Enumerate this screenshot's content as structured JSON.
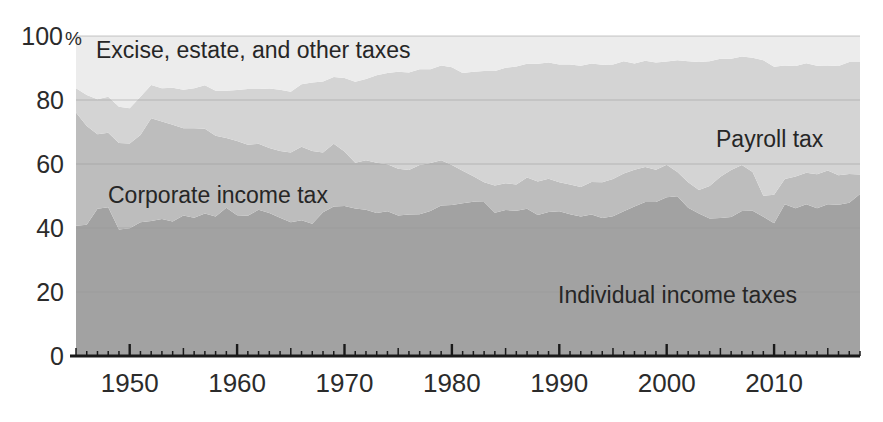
{
  "chart_data": {
    "type": "area",
    "stacked": true,
    "normalized_percent": true,
    "title": "",
    "subtitle": "",
    "xlabel": "",
    "ylabel": "",
    "ylim": [
      0,
      100
    ],
    "xlim": [
      1945,
      2018
    ],
    "grid": true,
    "legend_position": "inline-annotations",
    "y_ticks": [
      0,
      20,
      40,
      60,
      80,
      100
    ],
    "y_tick_labels": [
      "0",
      "20",
      "40",
      "60",
      "80",
      "100"
    ],
    "y_axis_unit_suffix": "%",
    "x_ticks_major": [
      1950,
      1960,
      1970,
      1980,
      1990,
      2000,
      2010
    ],
    "x_tick_labels": [
      "1950",
      "1960",
      "1970",
      "1980",
      "1990",
      "2000",
      "2010"
    ],
    "x_minor_tick_interval": 1,
    "x_major_tick_interval": 10,
    "colors": {
      "individual_income_taxes": "#a2a2a2",
      "corporate_income_tax": "#bdbdbd",
      "payroll_tax": "#d4d4d4",
      "excise_estate_other": "#ececec",
      "axis": "#1a1a1a",
      "gridline": "#9a9a9a",
      "text": "#262626",
      "background": "#ffffff"
    },
    "annotations": [
      {
        "name": "excise-estate-other-label",
        "text": "Excise, estate, and other taxes",
        "x_px": 96,
        "y_px": 58
      },
      {
        "name": "payroll-tax-label",
        "text": "Payroll tax",
        "x_px": 716,
        "y_px": 147
      },
      {
        "name": "corporate-income-tax-label",
        "text": "Corporate income tax",
        "x_px": 108,
        "y_px": 203
      },
      {
        "name": "individual-income-taxes-label",
        "text": "Individual income taxes",
        "x_px": 558,
        "y_px": 303
      }
    ],
    "x": [
      1945,
      1946,
      1947,
      1948,
      1949,
      1950,
      1951,
      1952,
      1953,
      1954,
      1955,
      1956,
      1957,
      1958,
      1959,
      1960,
      1961,
      1962,
      1963,
      1964,
      1965,
      1966,
      1967,
      1968,
      1969,
      1970,
      1971,
      1972,
      1973,
      1974,
      1975,
      1976,
      1977,
      1978,
      1979,
      1980,
      1981,
      1982,
      1983,
      1984,
      1985,
      1986,
      1987,
      1988,
      1989,
      1990,
      1991,
      1992,
      1993,
      1994,
      1995,
      1996,
      1997,
      1998,
      1999,
      2000,
      2001,
      2002,
      2003,
      2004,
      2005,
      2006,
      2007,
      2008,
      2009,
      2010,
      2011,
      2012,
      2013,
      2014,
      2015,
      2016,
      2017,
      2018
    ],
    "series": [
      {
        "name": "Individual income taxes",
        "key": "individual_income_taxes",
        "color": "#a2a2a2",
        "values": [
          40.7,
          41.0,
          46.0,
          46.5,
          39.5,
          39.9,
          41.8,
          42.2,
          42.8,
          42.0,
          43.9,
          43.2,
          44.5,
          43.6,
          46.3,
          44.0,
          43.8,
          45.7,
          44.7,
          43.2,
          41.8,
          42.4,
          41.3,
          44.9,
          46.7,
          46.9,
          46.1,
          45.7,
          44.7,
          45.2,
          43.9,
          44.2,
          44.3,
          45.3,
          47.0,
          47.2,
          47.7,
          48.2,
          48.1,
          44.8,
          45.6,
          45.4,
          46.0,
          44.1,
          45.0,
          45.2,
          44.3,
          43.6,
          44.2,
          43.1,
          43.7,
          45.2,
          46.7,
          48.1,
          48.1,
          49.6,
          49.9,
          46.3,
          44.5,
          43.0,
          43.1,
          43.4,
          45.3,
          45.4,
          43.5,
          41.5,
          47.4,
          46.2,
          47.4,
          46.2,
          47.4,
          47.3,
          47.9,
          50.6
        ]
      },
      {
        "name": "Corporate income tax",
        "key": "corporate_income_tax",
        "color": "#bdbdbd",
        "values": [
          35.4,
          30.9,
          23.3,
          23.3,
          27.1,
          26.5,
          27.3,
          32.1,
          30.5,
          30.3,
          27.3,
          28.0,
          26.5,
          25.2,
          21.8,
          23.2,
          22.2,
          20.6,
          20.3,
          20.9,
          21.8,
          23.0,
          22.8,
          18.7,
          19.6,
          17.0,
          14.3,
          15.5,
          15.7,
          14.7,
          14.6,
          13.9,
          15.4,
          15.0,
          14.2,
          12.5,
          10.2,
          8.0,
          6.2,
          8.5,
          8.4,
          8.2,
          9.8,
          10.4,
          10.4,
          9.1,
          9.3,
          9.2,
          10.2,
          11.2,
          11.6,
          11.8,
          11.5,
          11.0,
          10.1,
          10.2,
          7.6,
          8.0,
          7.4,
          10.1,
          12.9,
          14.7,
          14.4,
          12.1,
          6.6,
          8.9,
          7.9,
          9.9,
          9.9,
          10.6,
          10.6,
          9.2,
          9.0,
          6.1
        ]
      },
      {
        "name": "Payroll tax",
        "key": "payroll_tax",
        "color": "#d4d4d4",
        "values": [
          7.6,
          9.7,
          10.9,
          11.2,
          11.3,
          11.0,
          11.9,
          10.4,
          10.4,
          11.5,
          12.0,
          12.5,
          13.6,
          14.1,
          14.8,
          15.9,
          17.4,
          17.1,
          18.6,
          19.1,
          19.0,
          19.5,
          21.4,
          22.2,
          20.9,
          23.0,
          25.3,
          25.4,
          27.3,
          28.5,
          30.3,
          30.5,
          29.9,
          29.3,
          29.6,
          30.5,
          30.5,
          32.6,
          34.8,
          35.8,
          36.1,
          36.9,
          35.5,
          36.8,
          36.3,
          36.8,
          37.5,
          37.9,
          37.0,
          36.7,
          35.8,
          35.1,
          33.2,
          33.2,
          33.5,
          32.2,
          34.9,
          37.8,
          40.0,
          39.0,
          36.9,
          34.8,
          33.9,
          35.7,
          42.3,
          40.0,
          35.5,
          34.5,
          34.2,
          33.9,
          32.8,
          34.1,
          35.0,
          35.2
        ]
      },
      {
        "name": "Excise, estate, and other taxes",
        "key": "excise_estate_other",
        "color": "#ececec",
        "values": [
          16.3,
          18.4,
          19.8,
          19.0,
          22.1,
          22.6,
          19.0,
          15.3,
          16.3,
          16.2,
          16.8,
          16.3,
          15.4,
          17.1,
          17.1,
          16.9,
          16.6,
          16.6,
          16.4,
          16.8,
          17.4,
          15.1,
          14.5,
          14.2,
          12.8,
          13.1,
          14.3,
          13.4,
          12.3,
          11.6,
          11.2,
          11.4,
          10.4,
          10.4,
          9.2,
          9.8,
          11.6,
          11.2,
          10.9,
          10.9,
          9.9,
          9.5,
          8.7,
          8.7,
          8.3,
          8.9,
          8.9,
          9.3,
          8.6,
          9.0,
          8.9,
          7.9,
          8.6,
          7.7,
          8.3,
          8.0,
          7.6,
          7.9,
          8.1,
          7.9,
          7.1,
          7.1,
          6.4,
          6.8,
          7.6,
          9.6,
          9.2,
          9.4,
          8.5,
          9.3,
          9.2,
          9.4,
          8.1,
          8.1
        ]
      }
    ]
  }
}
